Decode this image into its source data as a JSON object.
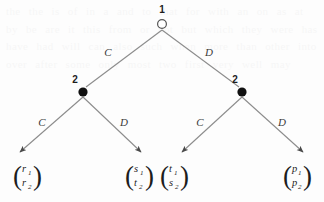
{
  "figure": {
    "kind": "extensive-form-game-tree",
    "background_ghost_text": "the the is of in a and to that for with an on as at by be are it this from or not but which they were has have had will can also such when more than other into over after some only most two first very well may"
  },
  "nodes": {
    "root": {
      "label": "1",
      "player": "1",
      "style": "open-circle",
      "x": 162,
      "y": 24
    },
    "left": {
      "label": "2",
      "player": "2",
      "style": "filled-dot",
      "x": 83,
      "y": 92
    },
    "right": {
      "label": "2",
      "player": "2",
      "style": "filled-dot",
      "x": 242,
      "y": 92
    }
  },
  "edges": [
    {
      "id": "root-left",
      "label": "C",
      "from": "root",
      "to": "left",
      "label_x": 108,
      "label_y": 52
    },
    {
      "id": "root-right",
      "label": "D",
      "from": "root",
      "to": "right",
      "label_x": 208,
      "label_y": 52
    },
    {
      "id": "left-terminal-1",
      "label": "C",
      "from": "left",
      "to": "terminal-1",
      "label_x": 42,
      "label_y": 122
    },
    {
      "id": "left-terminal-2",
      "label": "D",
      "from": "left",
      "to": "terminal-2",
      "label_x": 123,
      "label_y": 122
    },
    {
      "id": "right-terminal-3",
      "label": "C",
      "from": "right",
      "to": "terminal-3",
      "label_x": 200,
      "label_y": 122
    },
    {
      "id": "right-terminal-4",
      "label": "D",
      "from": "right",
      "to": "terminal-4",
      "label_x": 281,
      "label_y": 122
    }
  ],
  "terminals": [
    {
      "id": "terminal-1",
      "top": "r",
      "top_sub": "1",
      "bottom": "r",
      "bottom_sub": "2",
      "x": 28,
      "y": 175
    },
    {
      "id": "terminal-2",
      "top": "s",
      "top_sub": "1",
      "bottom": "t",
      "bottom_sub": "2",
      "x": 140,
      "y": 175
    },
    {
      "id": "terminal-3",
      "top": "t",
      "top_sub": "1",
      "bottom": "s",
      "bottom_sub": "2",
      "x": 175,
      "y": 175
    },
    {
      "id": "terminal-4",
      "top": "p",
      "top_sub": "1",
      "bottom": "p",
      "bottom_sub": "2",
      "x": 298,
      "y": 175
    }
  ],
  "colors": {
    "line": "#8c8c8c",
    "node_fill": "#111111",
    "text": "#1d1d1d",
    "background": "#fdfdfd"
  }
}
